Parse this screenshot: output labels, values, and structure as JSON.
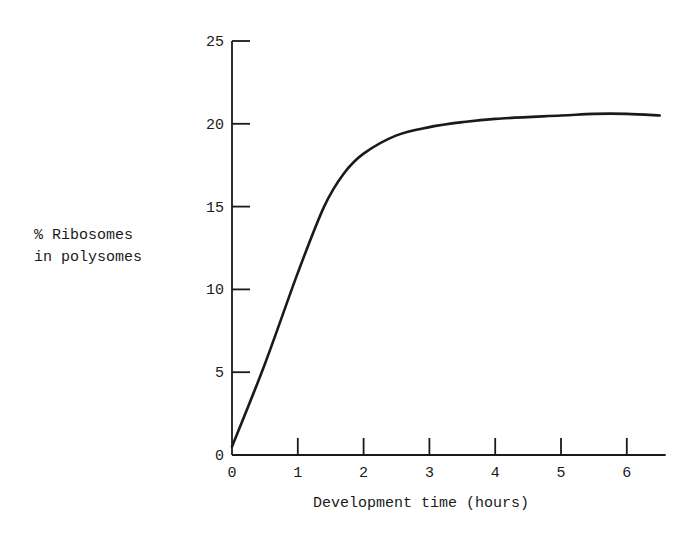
{
  "chart_data": {
    "type": "line",
    "title": "",
    "xlabel": "Development time (hours)",
    "ylabel": "% Ribosomes in polysomes",
    "ylabel_lines": [
      "% Ribosomes",
      "in polysomes"
    ],
    "xlim": [
      0,
      6.5
    ],
    "ylim": [
      0,
      25
    ],
    "xticks": [
      0,
      1,
      2,
      3,
      4,
      5,
      6
    ],
    "yticks": [
      0,
      5,
      10,
      15,
      20,
      25
    ],
    "grid": false,
    "legend": null,
    "series": [
      {
        "name": "% Ribosomes in polysomes",
        "x": [
          0,
          0.5,
          1,
          1.4,
          1.7,
          2,
          2.5,
          3,
          3.5,
          4,
          5,
          5.5,
          6,
          6.5
        ],
        "values": [
          0.5,
          5.5,
          11,
          15,
          17,
          18.2,
          19.3,
          19.8,
          20.1,
          20.3,
          20.5,
          20.6,
          20.6,
          20.5
        ]
      }
    ]
  },
  "colors": {
    "ink": "#1a1a1a",
    "background": "#ffffff"
  }
}
